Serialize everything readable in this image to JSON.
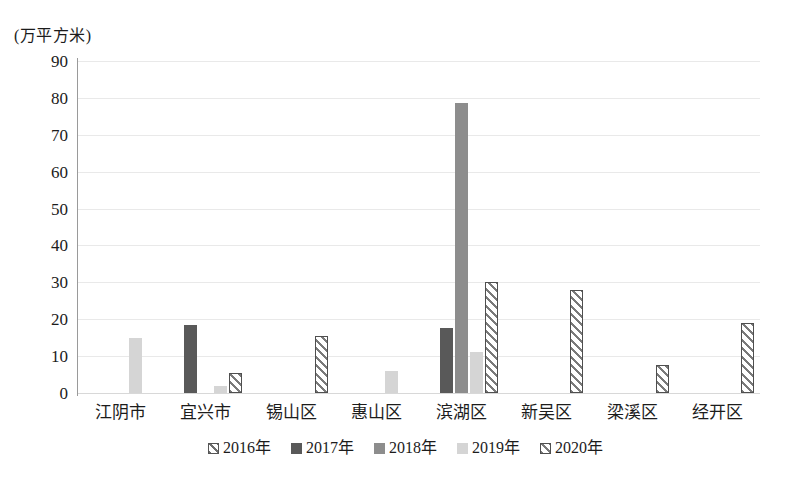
{
  "chart_data": {
    "type": "bar",
    "title": "",
    "subtitle": "",
    "xlabel": "",
    "ylabel": "(万平方米)",
    "ylim": [
      0,
      90
    ],
    "ytick_step": 10,
    "yticks": [
      "90",
      "80",
      "70",
      "60",
      "50",
      "40",
      "30",
      "20",
      "10",
      "0"
    ],
    "grid": true,
    "legend_position": "bottom",
    "categories": [
      "江阴市",
      "宜兴市",
      "锡山区",
      "惠山区",
      "滨湖区",
      "新吴区",
      "梁溪区",
      "经开区"
    ],
    "series": [
      {
        "name": "2016年",
        "color": "#ffffff",
        "pattern": "diagonal-hatch",
        "values": [
          0,
          0,
          0,
          0,
          0,
          0,
          0,
          0
        ]
      },
      {
        "name": "2017年",
        "color": "#595959",
        "pattern": "solid",
        "values": [
          0,
          18.5,
          0,
          0,
          17.5,
          0,
          0,
          0
        ]
      },
      {
        "name": "2018年",
        "color": "#8d8d8d",
        "pattern": "solid",
        "values": [
          0,
          0,
          0,
          0,
          78.5,
          0,
          0,
          0
        ]
      },
      {
        "name": "2019年",
        "color": "#d5d5d5",
        "pattern": "solid",
        "values": [
          15,
          2,
          0,
          6,
          11,
          0,
          0,
          0
        ]
      },
      {
        "name": "2020年",
        "color": "#ffffff",
        "pattern": "diagonal-hatch",
        "values": [
          0,
          5.5,
          15.5,
          0,
          30,
          28,
          7.5,
          19
        ]
      }
    ]
  },
  "legend": {
    "items": [
      {
        "label": "2016年",
        "class": "s2016"
      },
      {
        "label": "2017年",
        "class": "s2017"
      },
      {
        "label": "2018年",
        "class": "s2018"
      },
      {
        "label": "2019年",
        "class": "s2019"
      },
      {
        "label": "2020年",
        "class": "s2020"
      }
    ]
  }
}
